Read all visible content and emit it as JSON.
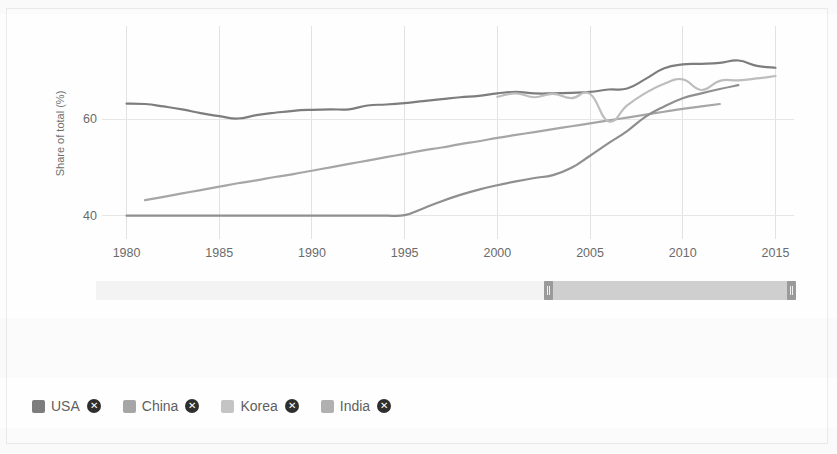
{
  "chart_data": {
    "type": "line",
    "title": "",
    "xlabel": "",
    "ylabel": "Share of total (%)",
    "xlim": [
      1979,
      2016
    ],
    "ylim": [
      36,
      78
    ],
    "xticks": [
      1980,
      1985,
      1990,
      1995,
      2000,
      2005,
      2010,
      2015
    ],
    "xtick_labels": [
      "1980",
      "1985",
      "1990",
      "1995",
      "2000",
      "2005",
      "2010",
      "2015"
    ],
    "yticks": [
      40,
      60
    ],
    "ytick_labels": [
      "40",
      "60"
    ],
    "grid": true,
    "legend_position": "bottom-left",
    "series": [
      {
        "name": "USA",
        "color": "#7d7d7d",
        "x": [
          1980,
          1981,
          1982,
          1983,
          1984,
          1985,
          1986,
          1987,
          1988,
          1989,
          1990,
          1991,
          1992,
          1993,
          1994,
          1995,
          1996,
          1997,
          1998,
          1999,
          2000,
          2001,
          2002,
          2003,
          2004,
          2005,
          2006,
          2007,
          2008,
          2009,
          2010,
          2011,
          2012,
          2013,
          2014,
          2015
        ],
        "values": [
          63.2,
          63.1,
          62.6,
          62.0,
          61.2,
          60.6,
          60.1,
          60.8,
          61.3,
          61.7,
          61.9,
          62.0,
          62.0,
          62.8,
          63.0,
          63.3,
          63.7,
          64.1,
          64.5,
          64.8,
          65.3,
          65.6,
          65.3,
          65.3,
          65.4,
          65.6,
          66.1,
          66.3,
          68.3,
          70.5,
          71.3,
          71.4,
          71.6,
          72.1,
          71.0,
          70.6
        ]
      },
      {
        "name": "China",
        "color": "#a6a6a6",
        "x": [
          1981,
          1982,
          1983,
          1984,
          1985,
          1986,
          1987,
          1988,
          1989,
          1990,
          1991,
          1992,
          1993,
          1994,
          1995,
          1996,
          1997,
          1998,
          1999,
          2000,
          2001,
          2002,
          2003,
          2004,
          2005,
          2006,
          2007,
          2008,
          2009,
          2010,
          2011,
          2012
        ],
        "values": [
          43.2,
          43.9,
          44.6,
          45.3,
          46.0,
          46.7,
          47.3,
          48.0,
          48.6,
          49.3,
          50.0,
          50.7,
          51.4,
          52.1,
          52.8,
          53.5,
          54.1,
          54.8,
          55.4,
          56.1,
          56.7,
          57.3,
          57.9,
          58.5,
          59.1,
          59.7,
          60.3,
          60.9,
          61.5,
          62.1,
          62.6,
          63.1
        ]
      },
      {
        "name": "Korea",
        "color": "#bdbdbd",
        "x": [
          2000,
          2001,
          2002,
          2003,
          2004,
          2005,
          2006,
          2007,
          2008,
          2009,
          2010,
          2011,
          2012,
          2013,
          2014,
          2015
        ],
        "values": [
          64.6,
          65.3,
          64.5,
          65.2,
          64.3,
          65.2,
          59.5,
          62.8,
          65.4,
          67.3,
          68.2,
          66.0,
          67.9,
          68.0,
          68.4,
          68.9
        ]
      },
      {
        "name": "India",
        "color": "#8f8f8f",
        "x": [
          1980,
          1981,
          1982,
          1983,
          1984,
          1985,
          1986,
          1987,
          1988,
          1989,
          1990,
          1991,
          1992,
          1993,
          1994,
          1995,
          1996,
          1997,
          1998,
          1999,
          2000,
          2001,
          2002,
          2003,
          2004,
          2005,
          2006,
          2007,
          2008,
          2009,
          2010,
          2011,
          2012,
          2013
        ],
        "values": [
          40.0,
          40.0,
          40.0,
          40.0,
          40.0,
          40.0,
          40.0,
          40.0,
          40.0,
          40.0,
          40.0,
          40.0,
          40.0,
          40.0,
          40.0,
          40.1,
          41.5,
          43.0,
          44.3,
          45.4,
          46.3,
          47.1,
          47.8,
          48.4,
          49.9,
          52.4,
          55.0,
          57.5,
          60.5,
          62.6,
          64.3,
          65.3,
          66.2,
          67.0
        ]
      }
    ]
  },
  "legend": {
    "items": [
      {
        "label": "USA",
        "color": "#7d7d7d",
        "remove_glyph": "✕"
      },
      {
        "label": "China",
        "color": "#a6a6a6",
        "remove_glyph": "✕"
      },
      {
        "label": "Korea",
        "color": "#c4c4c4",
        "remove_glyph": "✕"
      },
      {
        "label": "India",
        "color": "#b0b0b0",
        "remove_glyph": "✕"
      }
    ]
  },
  "range_slider": {
    "track_color": "#f3f3f3",
    "selection_color": "#cfcfcf",
    "handle_color": "#9a9a9a",
    "selection_start_pct": 64,
    "selection_end_pct": 100
  }
}
